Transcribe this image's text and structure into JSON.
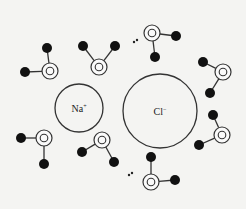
{
  "diagram": {
    "title": "",
    "ions": [
      {
        "id": "sodium",
        "label": "Na",
        "charge": "+",
        "cx": 79,
        "cy": 108,
        "r": 24
      },
      {
        "id": "chloride",
        "label": "Cl",
        "charge": "−",
        "cx": 160,
        "cy": 111,
        "r": 37
      }
    ],
    "water_molecules": [
      {
        "o": [
          50,
          71
        ],
        "h1": [
          47,
          48
        ],
        "h2": [
          25,
          72
        ],
        "lone_pair": null
      },
      {
        "o": [
          99,
          67
        ],
        "h1": [
          83,
          46
        ],
        "h2": [
          115,
          46
        ],
        "lone_pair": null
      },
      {
        "o": [
          152,
          33
        ],
        "h1": [
          176,
          36
        ],
        "h2": [
          155,
          57
        ],
        "lone_pair": [
          134,
          41
        ]
      },
      {
        "o": [
          223,
          72
        ],
        "h1": [
          203,
          62
        ],
        "h2": [
          210,
          93
        ],
        "lone_pair": null
      },
      {
        "o": [
          222,
          135
        ],
        "h1": [
          213,
          115
        ],
        "h2": [
          199,
          145
        ],
        "lone_pair": null
      },
      {
        "o": [
          44,
          138
        ],
        "h1": [
          21,
          138
        ],
        "h2": [
          44,
          164
        ],
        "lone_pair": null
      },
      {
        "o": [
          102,
          140
        ],
        "h1": [
          82,
          152
        ],
        "h2": [
          114,
          162
        ],
        "lone_pair": null
      },
      {
        "o": [
          151,
          182
        ],
        "h1": [
          151,
          157
        ],
        "h2": [
          175,
          180
        ],
        "lone_pair": [
          129,
          174
        ]
      }
    ],
    "colors": {
      "background": "#f4f4f2",
      "stroke": "#333333",
      "hydrogen": "#111111"
    }
  }
}
